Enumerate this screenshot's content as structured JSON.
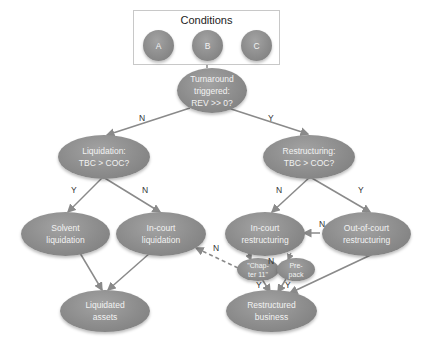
{
  "conditions": {
    "title": "Conditions",
    "items": [
      "A",
      "B",
      "C"
    ]
  },
  "nodes": {
    "turnaround": "Turnaround\ntriggered:\nREV >> 0?",
    "liquidation_q": "Liquidation:\nTBC > COC?",
    "restructuring_q": "Restructuring:\nTBC > COC?",
    "solvent_liquidation": "Solvent\nliquidation",
    "incourt_liquidation": "In-court\nliquidation",
    "incourt_restructuring": "In-court\nrestructuring",
    "outofcourt_restructuring": "Out-of-court\nrestructuring",
    "chapter11": "\"Chap-\nter 11\"",
    "prepack": "Pre-\npack",
    "liquidated_assets": "Liquidated\nassets",
    "restructured_business": "Restructured\nbusiness"
  },
  "edge_labels": {
    "turnaround_to_liquidation": "N",
    "turnaround_to_restructuring": "Y",
    "liquidation_to_solvent": "Y",
    "liquidation_to_incourt": "N",
    "restructuring_to_incourt": "N",
    "restructuring_to_outofcourt": "Y",
    "outofcourt_to_incourt": "N",
    "chapter11_to_incourt_liquidation": "N",
    "prepack_to_chapter11": "N",
    "chapter11_to_restructured": "Y",
    "prepack_to_restructured": "Y"
  },
  "colors": {
    "node_fill": "#8c8c8c",
    "node_text": "#f2f2f2",
    "edge": "#8a8a8a",
    "box_border": "#c8c8c8"
  }
}
